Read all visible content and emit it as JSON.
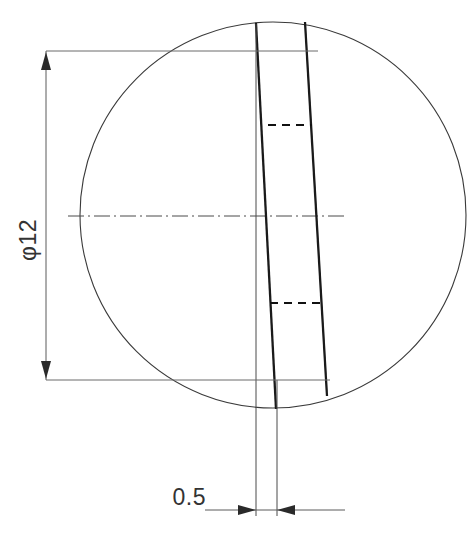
{
  "drawing": {
    "title": "Slot through circular section",
    "type": "engineering-drawing",
    "background_color": "#ffffff",
    "line_color": "#333333",
    "canvas": {
      "width": 473,
      "height": 536
    },
    "dimensions": [
      {
        "id": "diameter",
        "label": "φ12",
        "value": 12,
        "symbol": "φ",
        "orientation": "vertical",
        "text_rotation": -90,
        "text_x": 32,
        "text_y": 240
      },
      {
        "id": "slot-width",
        "label": "0.5",
        "value": 0.5,
        "symbol": "",
        "orientation": "horizontal",
        "text_rotation": 0,
        "text_x": 206,
        "text_y": 505
      }
    ],
    "geometry": {
      "circle": {
        "cx": 273,
        "cy": 215,
        "r": 193
      },
      "centerline": {
        "x1": 68,
        "y1": 216,
        "x2": 348,
        "y2": 216
      },
      "slot_left_edge": {
        "x1": 256,
        "y1": 23,
        "x2": 276,
        "y2": 409
      },
      "slot_right_edge": {
        "x1": 305,
        "y1": 22,
        "x2": 327,
        "y2": 396
      },
      "hidden_line_upper": {
        "x1": 268,
        "y1": 125,
        "x2": 312,
        "y2": 125
      },
      "hidden_line_lower": {
        "x1": 270,
        "y1": 303,
        "x2": 320,
        "y2": 303
      },
      "extension_line_top": {
        "x1": 46,
        "y1": 51,
        "x2": 318,
        "y2": 51
      },
      "extension_line_bottom": {
        "x1": 46,
        "y1": 380,
        "x2": 330,
        "y2": 380
      },
      "dimension_line_vertical": {
        "x": 46,
        "y1": 51,
        "y2": 380
      },
      "dimension_line_horizontal": {
        "y": 510,
        "x1": 205,
        "x2": 345
      },
      "slot_extension_left": {
        "x": 256,
        "y1": 400,
        "y2": 516
      },
      "slot_extension_right": {
        "x": 277,
        "y1": 400,
        "y2": 516
      }
    },
    "arrows": [
      {
        "id": "diameter-arrow-top",
        "direction": "up",
        "x": 46,
        "y": 53
      },
      {
        "id": "diameter-arrow-bottom",
        "direction": "down",
        "x": 46,
        "y": 378
      },
      {
        "id": "slot-arrow-left",
        "direction": "right",
        "x": 255,
        "y": 510
      },
      {
        "id": "slot-arrow-right",
        "direction": "left",
        "x": 278,
        "y": 510
      }
    ]
  }
}
